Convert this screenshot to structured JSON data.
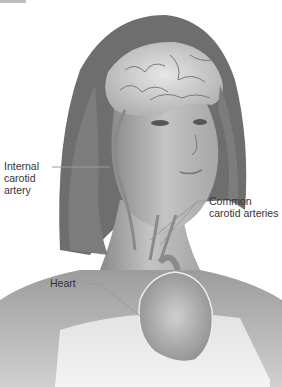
{
  "figure": {
    "labels": {
      "internal_carotid": [
        "Internal",
        "carotid",
        "artery"
      ],
      "common_carotid": [
        "Common",
        "carotid arteries"
      ],
      "heart": "Heart"
    },
    "colors": {
      "background": "#ffffff",
      "skin": "#b8b8b8",
      "hair": "#6e6e6e",
      "brain": "#d8d8d8",
      "leader_line": "#9a9a9a",
      "label_text": "#333333"
    }
  }
}
